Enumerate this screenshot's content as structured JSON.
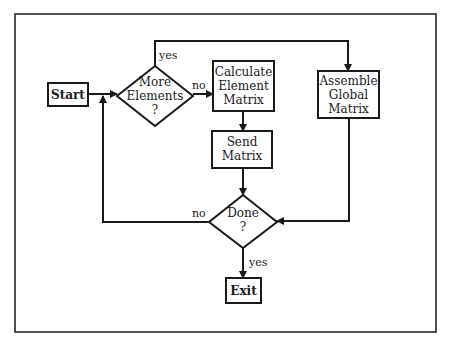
{
  "diagram": {
    "type": "flowchart",
    "nodes": {
      "start": {
        "label": "Start",
        "shape": "rectangle",
        "style": "bold"
      },
      "more_elements": {
        "line1": "More",
        "line2": "Elements",
        "line3": "?",
        "shape": "diamond"
      },
      "calculate": {
        "line1": "Calculate",
        "line2": "Element",
        "line3": "Matrix",
        "shape": "rectangle"
      },
      "send": {
        "line1": "Send",
        "line2": "Matrix",
        "shape": "rectangle"
      },
      "assemble": {
        "line1": "Assemble",
        "line2": "Global",
        "line3": "Matrix",
        "shape": "rectangle"
      },
      "done": {
        "line1": "Done",
        "line2": "?",
        "shape": "diamond"
      },
      "exit": {
        "label": "Exit",
        "shape": "rectangle",
        "style": "bold"
      }
    },
    "edges": [
      {
        "from": "start",
        "to": "more_elements",
        "label": ""
      },
      {
        "from": "more_elements",
        "to": "calculate",
        "label": "no"
      },
      {
        "from": "more_elements",
        "to": "assemble",
        "label": "yes"
      },
      {
        "from": "calculate",
        "to": "send",
        "label": ""
      },
      {
        "from": "send",
        "to": "done",
        "label": ""
      },
      {
        "from": "assemble",
        "to": "done",
        "label": ""
      },
      {
        "from": "done",
        "to": "more_elements",
        "label": "no"
      },
      {
        "from": "done",
        "to": "exit",
        "label": "yes"
      }
    ],
    "edge_labels": {
      "more_yes": "yes",
      "more_no": "no",
      "done_no": "no",
      "done_yes": "yes"
    },
    "colors": {
      "stroke": "#1a1a1a",
      "background": "#ffffff"
    }
  }
}
